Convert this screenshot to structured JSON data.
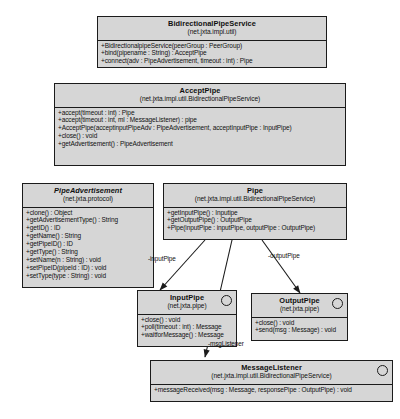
{
  "diagram": {
    "style": {
      "box_fill": "#d6d6d6",
      "border": "#1b1b1b",
      "text": "#101010",
      "background": "#ffffff"
    }
  },
  "classes": [
    {
      "id": "bidirectionalpipeservice",
      "name": "BidirectionalPipeService",
      "package": "(net.jxta.impl.util)",
      "stereotype": "class",
      "abstract": false,
      "interface": false,
      "operations": [
        "+BidirectionalpipeService(peerGroup : PeerGroup)",
        "+bind(pipename : String) : AcceptPipe",
        "+connect(adv : PipeAdvertisement, timeout : int) : Pipe"
      ]
    },
    {
      "id": "acceptpipe",
      "name": "AcceptPipe",
      "package": "(net.jxta.impl.util.BidirectionalPipeService)",
      "stereotype": "class",
      "abstract": false,
      "interface": false,
      "operations": [
        "+accept(timeout : int) : Pipe",
        "+accept(timeout : int, ml : MessageListener) : pipe",
        "+AcceptPipe(acceptinputPipeAdv : PipeAdvertisement, acceptInputPipe : InputPipe)",
        "+close() : void",
        "+getAdvertisement() : PipeAdvertisement"
      ]
    },
    {
      "id": "pipeadvertisement",
      "name": "PipeAdvertisement",
      "package": "(net.jxta.protocol)",
      "stereotype": "abstract class",
      "abstract": true,
      "interface": false,
      "operations": [
        "+clone() : Object",
        "+getAdvertisementType() : String",
        "+getID() : ID",
        "+getName() : String",
        "+getPipeID() : ID",
        "+getType() : String",
        "+setName(n : String) : void",
        "+setPipeID(pipeId : ID) : void",
        "+setType(type : String) : void"
      ]
    },
    {
      "id": "pipe",
      "name": "Pipe",
      "package": "(net.jxta.impl.util.BidirectionalPipeService)",
      "stereotype": "class",
      "abstract": false,
      "interface": false,
      "operations": [
        "+getInputPipe() : Inputipe",
        "+getOutputPipe() : OutputPipe",
        "+Pipe(inputPipe : inputPipe, outputPipe : OutputPipe)"
      ]
    },
    {
      "id": "inputpipe",
      "name": "InputPipe",
      "package": "(net.jxta.pipe)",
      "stereotype": "interface",
      "abstract": false,
      "interface": true,
      "operations": [
        "+close() : void",
        "+poll(timeout : int) : Message",
        "+waitforMessage() : Message"
      ]
    },
    {
      "id": "outputpipe",
      "name": "OutputPipe",
      "package": "(net.jxta.pipe)",
      "stereotype": "interface",
      "abstract": false,
      "interface": true,
      "operations": [
        "+close() : void",
        "+send(msg : Message) : void"
      ]
    },
    {
      "id": "messagelistener",
      "name": "MessageListener",
      "package": "(net.jxta.impl.util.BidirectionalPipeService)",
      "stereotype": "interface",
      "abstract": false,
      "interface": true,
      "operations": [
        "+messageReceived(msg : Message, responsePipe : OutputPipe) : void"
      ]
    }
  ],
  "associations": [
    {
      "id": "assoc-inputpipe",
      "label": "-inputPipe",
      "from": "pipe",
      "to": "inputpipe"
    },
    {
      "id": "assoc-outputpipe",
      "label": "-outputPipe",
      "from": "pipe",
      "to": "outputpipe"
    },
    {
      "id": "assoc-msglistener",
      "label": "-msgListener",
      "from": "pipe",
      "to": "messagelistener"
    }
  ]
}
